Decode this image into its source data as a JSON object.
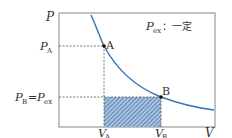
{
  "diagram": {
    "axes": {
      "y_label": "P",
      "x_label": "V"
    },
    "annotation": {
      "symbol": "P",
      "subscript": "ex",
      "text": "：一定"
    },
    "points": [
      {
        "name": "A",
        "x_label": "V",
        "x_sub": "A",
        "y_label": "P",
        "y_sub": "A"
      },
      {
        "name": "B",
        "x_label": "V",
        "x_sub": "B",
        "y_label": "P",
        "y_sub": "B"
      }
    ],
    "pb_label": {
      "lhs": "P",
      "lhs_sub": "B",
      "eq": "=",
      "rhs": "P",
      "rhs_sub": "ex"
    },
    "colors": {
      "curve": "#3a78b5",
      "frame": "#999999",
      "hatch": "#3a6ea5",
      "hatch_bg": "#a9c3e0",
      "dotted": "#555555",
      "point": "#111111"
    }
  }
}
